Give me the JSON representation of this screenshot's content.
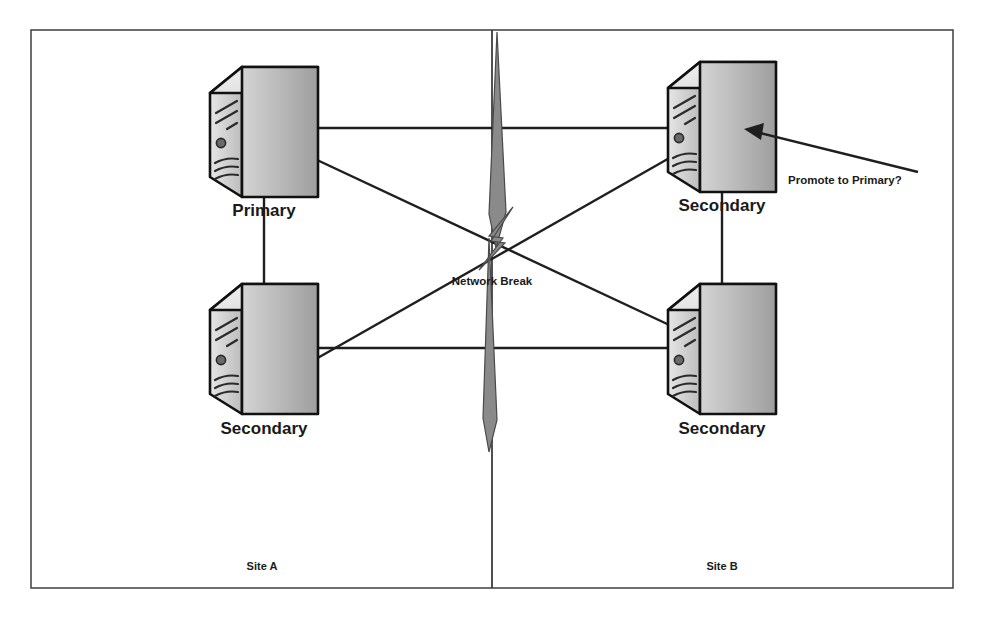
{
  "diagram": {
    "frame": {
      "visible": true,
      "color": "#4a4a4a"
    },
    "divider": {
      "label": "site-divider",
      "color": "#3d3d3d"
    },
    "sites": [
      {
        "id": "site-a",
        "label": "Site A",
        "x": 262,
        "y": 570
      },
      {
        "id": "site-b",
        "label": "Site B",
        "x": 722,
        "y": 570
      }
    ],
    "nodes": [
      {
        "id": "node-primary",
        "label": "Primary",
        "role": "primary",
        "site": "site-a",
        "icon": "server-icon",
        "x": 264,
        "y": 135,
        "label_x": 264,
        "label_y": 216
      },
      {
        "id": "node-secondary-a",
        "label": "Secondary",
        "role": "secondary",
        "site": "site-a",
        "icon": "server-icon",
        "x": 264,
        "y": 352,
        "label_x": 264,
        "label_y": 434
      },
      {
        "id": "node-secondary-b-top",
        "label": "Secondary",
        "role": "secondary",
        "site": "site-b",
        "icon": "server-icon",
        "x": 722,
        "y": 130,
        "label_x": 722,
        "label_y": 211
      },
      {
        "id": "node-secondary-b-bottom",
        "label": "Secondary",
        "role": "secondary",
        "site": "site-b",
        "icon": "server-icon",
        "x": 722,
        "y": 352,
        "label_x": 722,
        "label_y": 434
      }
    ],
    "links": [
      {
        "id": "link-primary-to-secb-top",
        "from": "node-primary",
        "to": "node-secondary-b-top",
        "style": "solid"
      },
      {
        "id": "link-primary-to-secb-bottom",
        "from": "node-primary",
        "to": "node-secondary-b-bottom",
        "style": "solid"
      },
      {
        "id": "link-seca-to-secb-top",
        "from": "node-secondary-a",
        "to": "node-secondary-b-top",
        "style": "solid"
      },
      {
        "id": "link-seca-to-secb-bottom",
        "from": "node-secondary-a",
        "to": "node-secondary-b-bottom",
        "style": "solid"
      },
      {
        "id": "link-primary-to-seca",
        "from": "node-primary",
        "to": "node-secondary-a",
        "style": "solid"
      },
      {
        "id": "link-secb-top-to-secb-bottom",
        "from": "node-secondary-b-top",
        "to": "node-secondary-b-bottom",
        "style": "solid"
      }
    ],
    "break": {
      "id": "network-break",
      "label": "Network Break",
      "icon": "lightning-bolt-icon",
      "label_x": 492,
      "label_y": 285,
      "color": "#8a8a8a"
    },
    "annotation": {
      "id": "promote-annotation",
      "label": "Promote to Primary?",
      "target": "node-secondary-b-top",
      "text_x": 788,
      "text_y": 184,
      "arrow_from": [
        918,
        172
      ],
      "arrow_to": [
        748,
        130
      ]
    }
  }
}
